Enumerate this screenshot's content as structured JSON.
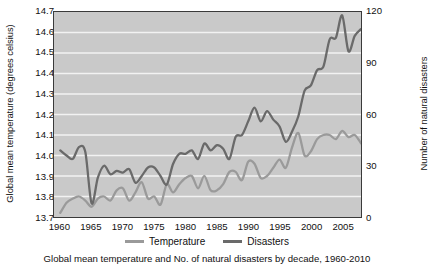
{
  "chart_data": {
    "type": "line",
    "title": "",
    "xlabel": "",
    "grid": true,
    "legend_position": "bottom",
    "colors": {
      "temperature": "#9a9a9a",
      "disasters": "#6a6a6a",
      "plot_background": "#c9c9c9",
      "gridline": "#f2f2f2",
      "axis": "#3a3a3a"
    },
    "x": [
      1960,
      1961,
      1962,
      1963,
      1964,
      1965,
      1966,
      1967,
      1968,
      1969,
      1970,
      1971,
      1972,
      1973,
      1974,
      1975,
      1976,
      1977,
      1978,
      1979,
      1980,
      1981,
      1982,
      1983,
      1984,
      1985,
      1986,
      1987,
      1988,
      1989,
      1990,
      1991,
      1992,
      1993,
      1994,
      1995,
      1996,
      1997,
      1998,
      1999,
      2000,
      2001,
      2002,
      2003,
      2004,
      2005,
      2006,
      2007,
      2008
    ],
    "xlim": [
      1959,
      2008
    ],
    "xticks": [
      1960,
      1965,
      1970,
      1975,
      1980,
      1985,
      1990,
      1995,
      2000,
      2005
    ],
    "axes": [
      {
        "id": "left",
        "label": "Global mean temperature (degrees celsius)",
        "ylim": [
          13.7,
          14.7
        ],
        "yticks": [
          13.7,
          13.8,
          13.9,
          14.0,
          14.1,
          14.2,
          14.3,
          14.4,
          14.5,
          14.6,
          14.7
        ],
        "ytick_labels": [
          "13.7",
          "13.8",
          "13.9",
          "14.0",
          "14.1",
          "14.2",
          "14.3",
          "14.4",
          "14.5",
          "14.6",
          "14.7"
        ]
      },
      {
        "id": "right",
        "label": "Number of natural disasters",
        "ylim": [
          0,
          120
        ],
        "yticks": [
          0,
          30,
          60,
          90,
          120
        ],
        "ytick_labels": [
          "0",
          "30",
          "60",
          "90",
          "120"
        ]
      }
    ],
    "series": [
      {
        "name": "Temperature",
        "axis": "left",
        "color": "#9a9a9a",
        "units": "degrees celsius",
        "values": [
          13.72,
          13.77,
          13.79,
          13.8,
          13.78,
          13.75,
          13.79,
          13.8,
          13.78,
          13.83,
          13.84,
          13.78,
          13.82,
          13.87,
          13.79,
          13.8,
          13.76,
          13.86,
          13.82,
          13.86,
          13.89,
          13.9,
          13.84,
          13.9,
          13.83,
          13.83,
          13.86,
          13.92,
          13.92,
          13.88,
          13.97,
          13.96,
          13.89,
          13.9,
          13.94,
          13.98,
          13.94,
          14.04,
          14.11,
          14.0,
          14.02,
          14.08,
          14.1,
          14.1,
          14.08,
          14.12,
          14.09,
          14.1,
          14.06
        ]
      },
      {
        "name": "Disasters",
        "axis": "right",
        "color": "#6a6a6a",
        "units": "count",
        "values": [
          39,
          36,
          34,
          41,
          38,
          8,
          23,
          30,
          25,
          27,
          26,
          28,
          20,
          24,
          29,
          29,
          24,
          19,
          31,
          37,
          37,
          39,
          34,
          43,
          39,
          42,
          40,
          34,
          47,
          48,
          56,
          64,
          56,
          62,
          57,
          53,
          44,
          50,
          59,
          74,
          77,
          86,
          88,
          104,
          105,
          118,
          97,
          106,
          110
        ]
      }
    ]
  },
  "legend": {
    "items": [
      {
        "label": "Temperature",
        "color": "#9a9a9a"
      },
      {
        "label": "Disasters",
        "color": "#6a6a6a"
      }
    ]
  },
  "caption": {
    "text": "Global mean temperature and No. of natural disasters by decade, 1960-2010"
  }
}
